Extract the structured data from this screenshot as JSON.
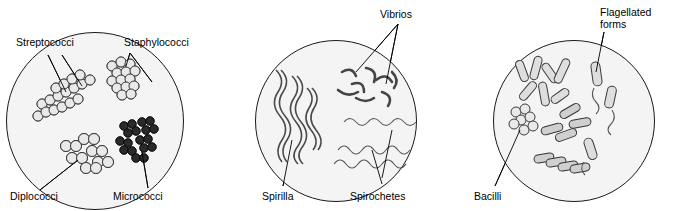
{
  "figure": {
    "panels": [
      {
        "id": "panel-cocci",
        "labels": [
          {
            "name": "label-streptococci",
            "text": "Streptococci"
          },
          {
            "name": "label-staphylococci",
            "text": "Staphylococci"
          },
          {
            "name": "label-diplococci",
            "text": "Diplococci"
          },
          {
            "name": "label-micrococci",
            "text": "Micrococci"
          }
        ]
      },
      {
        "id": "panel-spirals",
        "labels": [
          {
            "name": "label-vibrios",
            "text": "Vibrios"
          },
          {
            "name": "label-spirilla",
            "text": "Spirilla"
          },
          {
            "name": "label-spirochetes",
            "text": "Spirochetes"
          }
        ]
      },
      {
        "id": "panel-bacilli",
        "labels": [
          {
            "name": "label-flagellated-forms",
            "text": "Flagellated\nforms"
          },
          {
            "name": "label-bacilli",
            "text": "Bacilli"
          }
        ]
      }
    ],
    "colors": {
      "outline": "#1a1a1a",
      "field": "#f4f4f4",
      "cell_light": "#e9e9e9",
      "cell_dark": "#2a2a2a",
      "background": "#ffffff"
    }
  }
}
